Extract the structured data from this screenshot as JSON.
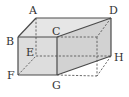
{
  "diagram": {
    "type": "cuboid-with-cutting-plane",
    "colors": {
      "edge": "#4a4a4a",
      "hidden_edge": "#5a5a5a",
      "face_light": "#e6e6e6",
      "face_mid": "#d9d9d9",
      "face_plane": "#cfcfcf",
      "label": "#333333"
    },
    "vertices": {
      "A": {
        "label": "A",
        "x": 36,
        "y": 18
      },
      "B": {
        "label": "B",
        "x": 18,
        "y": 37
      },
      "C": {
        "label": "C",
        "x": 57,
        "y": 37
      },
      "D": {
        "label": "D",
        "x": 111,
        "y": 18
      },
      "E": {
        "label": "E",
        "x": 36,
        "y": 56
      },
      "F": {
        "label": "F",
        "x": 18,
        "y": 75
      },
      "G": {
        "label": "G",
        "x": 57,
        "y": 75
      },
      "H": {
        "label": "H",
        "x": 111,
        "y": 56
      }
    },
    "hidden_vertices": {
      "front_right_top": {
        "x": 97,
        "y": 37
      },
      "front_right_bottom": {
        "x": 97,
        "y": 76
      }
    },
    "labels": {
      "A": "A",
      "B": "B",
      "C": "C",
      "D": "D",
      "E": "E",
      "F": "F",
      "G": "G",
      "H": "H"
    }
  }
}
